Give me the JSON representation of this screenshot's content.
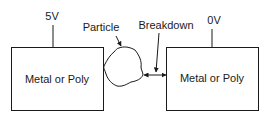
{
  "diagram": {
    "left_conductor": {
      "voltage_label": "5V",
      "box_label": "Metal or Poly"
    },
    "right_conductor": {
      "voltage_label": "0V",
      "box_label": "Metal or Poly"
    },
    "particle_label": "Particle",
    "breakdown_label": "Breakdown",
    "colors": {
      "stroke": "#1a1a1a",
      "background": "#ffffff"
    }
  }
}
